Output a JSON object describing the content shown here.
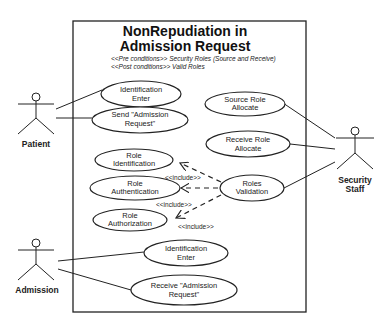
{
  "system": {
    "title_line1": "NonRepudiation in",
    "title_line2": "Admission Request",
    "pre_conditions": "<<Pre conditions>>   Security Roles (Source and Receive)",
    "post_conditions": "<<Post conditions>> Valid Roles"
  },
  "actors": {
    "patient": "Patient",
    "security_staff_line1": "Security",
    "security_staff_line2": "Staff",
    "admission": "Admission"
  },
  "use_cases": {
    "patient_id_enter": [
      "Identification",
      "Enter"
    ],
    "send_request": [
      "Send \"Admission",
      "Request\""
    ],
    "source_role": [
      "Source Role",
      "Allocate"
    ],
    "receive_role": [
      "Receive Role",
      "Allocate"
    ],
    "role_identification": [
      "Role",
      "Identification"
    ],
    "role_authentication": [
      "Role",
      "Authentication"
    ],
    "role_authorization": [
      "Role",
      "Authorization"
    ],
    "roles_validation": [
      "Roles",
      "Validation"
    ],
    "admission_id_enter": [
      "Identification",
      "Enter"
    ],
    "receive_request": [
      "Receive \"Admission",
      "Request\""
    ]
  },
  "relations": {
    "include_1": "<<include>>",
    "include_2": "<<include>>",
    "include_3": "<<include>>"
  }
}
